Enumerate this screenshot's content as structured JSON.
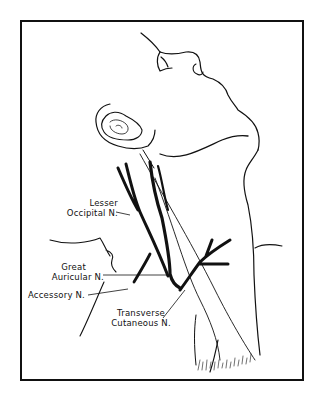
{
  "figure": {
    "type": "anatomical line drawing",
    "labels": {
      "lesser_occipital": [
        "Lesser",
        "Occipital N."
      ],
      "great_auricular": [
        "Great",
        "Auricular N."
      ],
      "accessory": "Accessory N.",
      "transverse_cutaneous": [
        "Transverse",
        "Cutaneous N."
      ]
    },
    "colors": {
      "ink": "#111111",
      "background": "#ffffff"
    }
  }
}
